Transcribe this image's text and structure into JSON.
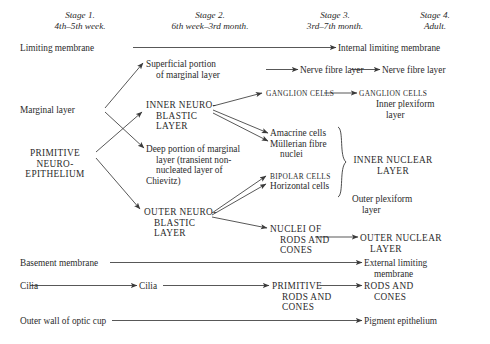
{
  "figure": {
    "ink_color": "#2b2b2b",
    "background": "#ffffff"
  },
  "headers": [
    {
      "name": "stage-1",
      "line1": "Stage 1.",
      "line2": "4th–5th week."
    },
    {
      "name": "stage-2",
      "line1": "Stage 2.",
      "line2": "6th week–3rd month."
    },
    {
      "name": "stage-3",
      "line1": "Stage 3.",
      "line2": "3rd–7th month."
    },
    {
      "name": "stage-4",
      "line1": "Stage 4.",
      "line2": "Adult."
    }
  ],
  "labels": {
    "limiting_membrane": "Limiting membrane",
    "internal_limiting_membrane": "Internal limiting membrane",
    "superficial_portion_l1": "Superficial portion",
    "superficial_portion_l2": "of marginal layer",
    "nerve_fibre_layer_s3": "Nerve fibre layer",
    "nerve_fibre_layer_s4": "Nerve fibre layer",
    "marginal_layer": "Marginal layer",
    "inner_neuroblastic_l1": "Inner neuro-",
    "inner_neuroblastic_l2": "blastic layer",
    "ganglion_cells_s3": "Ganglion cells",
    "ganglion_cells_s4": "Ganglion cells",
    "inner_plexiform_l1": "Inner plexiform",
    "inner_plexiform_l2": "layer",
    "primitive_neuroepithelium_l1": "Primitive neuro-",
    "primitive_neuroepithelium_l2": "epithelium",
    "deep_portion_l1": "Deep portion of marginal",
    "deep_portion_l2": "layer (transient non-",
    "deep_portion_l3": "nucleated layer of",
    "deep_portion_l4": "Chievitz)",
    "amacrine_cells": "Amacrine cells",
    "mullerian_l1": "Müllerian fibre",
    "mullerian_l2": "nuclei",
    "bipolar_cells": "Bipolar cells",
    "horizontal_cells": "Horizontal cells",
    "inner_nuclear_l1": "Inner nuclear",
    "inner_nuclear_l2": "layer",
    "outer_plexiform_l1": "Outer plexiform",
    "outer_plexiform_l2": "layer",
    "outer_neuroblastic_l1": "Outer neuro-",
    "outer_neuroblastic_l2": "blastic layer",
    "nuclei_rods_cones_l1": "Nuclei of",
    "nuclei_rods_cones_l2": "rods and",
    "nuclei_rods_cones_l3": "cones",
    "outer_nuclear_l1": "Outer nuclear",
    "outer_nuclear_l2": "layer",
    "basement_membrane": "Basement membrane",
    "external_limiting_l1": "External limiting",
    "external_limiting_l2": "membrane",
    "cilia_s1": "Cilia",
    "cilia_s2": "Cilia",
    "primitive_rods_l1": "Primitive",
    "primitive_rods_l2": "rods and",
    "primitive_rods_l3": "cones",
    "rods_and_cones_l1": "Rods and",
    "rods_and_cones_l2": "cones",
    "outer_wall_optic_cup": "Outer wall of optic cup",
    "pigment_epithelium": "Pigment epithelium",
    "brace_inner_nuclear": "}",
    "brace_glyph": "}"
  }
}
